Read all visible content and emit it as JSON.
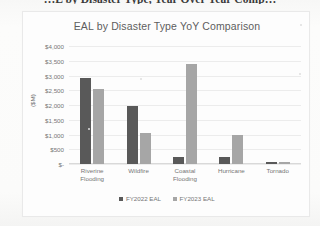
{
  "document": {
    "heading": "…L by Disaster Type, Year Over Year Comp…"
  },
  "chart_data": {
    "type": "bar",
    "title": "EAL by Disaster Type YoY Comparison",
    "xlabel": "",
    "ylabel": "($M)",
    "categories": [
      "Riverine Flooding",
      "Wildfire",
      "Coastal Flooding",
      "Hurricane",
      "Tornado"
    ],
    "series": [
      {
        "name": "FY2022 EAL",
        "color": "#595959",
        "values": [
          2900,
          1950,
          250,
          250,
          60
        ]
      },
      {
        "name": "FY2023 EAL",
        "color": "#a6a6a6",
        "values": [
          2550,
          1050,
          3400,
          1000,
          60
        ]
      }
    ],
    "ylim": [
      0,
      4000
    ],
    "ytick_labels": [
      "$4,000",
      "$3,500",
      "$3,000",
      "$2,500",
      "$2,000",
      "$1,500",
      "$1,000",
      "$500",
      "$-"
    ],
    "ytick_values": [
      4000,
      3500,
      3000,
      2500,
      2000,
      1500,
      1000,
      500,
      0
    ],
    "grid": true,
    "legend_position": "bottom",
    "legend": [
      "FY2022 EAL",
      "FY2023 EAL"
    ]
  },
  "colors": {
    "series_fy2022": "#595959",
    "series_fy2023": "#a6a6a6",
    "gridline": "#ececec",
    "text": "#767676",
    "chart_background": "#fdfdfd",
    "page_background": "#fbfbfa"
  }
}
